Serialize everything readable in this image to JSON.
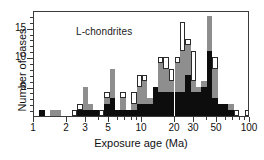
{
  "figure": {
    "annotation": "L-chondrites",
    "background": "#ffffff"
  },
  "axes": {
    "x_title": "Exposure age (Ma)",
    "y_title": "Number of cases",
    "x_scale": "log",
    "x_tick_labels": [
      "1",
      "2",
      "3",
      "5",
      "10",
      "20",
      "30",
      "50",
      "100"
    ],
    "y_tick_labels": [
      "5",
      "10",
      "15"
    ]
  },
  "colors": {
    "filled_black": "#0d0d0d",
    "filled_gray": "#8e8e8e",
    "open_white": "#ffffff",
    "axis": "#3a3a3a",
    "text": "#111111"
  },
  "chart_data": {
    "type": "bar",
    "title": "L-chondrites",
    "xlabel": "Exposure age (Ma)",
    "ylabel": "Number of cases",
    "xscale": "log",
    "xlim": [
      1,
      100
    ],
    "ylim": [
      0,
      18
    ],
    "grid": false,
    "legend": "none",
    "stacked": true,
    "bin_edges_note": "logarithmic bins between 1 and 100 Ma",
    "series": [
      {
        "name": "black",
        "color": "#0d0d0d"
      },
      {
        "name": "gray",
        "color": "#8e8e8e"
      },
      {
        "name": "white",
        "color": "#ffffff"
      }
    ],
    "bins": [
      {
        "x0": 1.0,
        "x1": 1.12,
        "black": 0,
        "gray": 0,
        "white": 0
      },
      {
        "x0": 1.12,
        "x1": 1.26,
        "black": 1,
        "gray": 0,
        "white": 0
      },
      {
        "x0": 1.26,
        "x1": 1.41,
        "black": 0,
        "gray": 0,
        "white": 0
      },
      {
        "x0": 1.41,
        "x1": 1.58,
        "black": 0,
        "gray": 1,
        "white": 0
      },
      {
        "x0": 1.58,
        "x1": 1.78,
        "black": 0,
        "gray": 1,
        "white": 0
      },
      {
        "x0": 1.78,
        "x1": 2.0,
        "black": 0,
        "gray": 0,
        "white": 0
      },
      {
        "x0": 2.0,
        "x1": 2.24,
        "black": 0,
        "gray": 0,
        "white": 0
      },
      {
        "x0": 2.24,
        "x1": 2.51,
        "black": 0,
        "gray": 0,
        "white": 1
      },
      {
        "x0": 2.51,
        "x1": 2.82,
        "black": 1,
        "gray": 0,
        "white": 1
      },
      {
        "x0": 2.82,
        "x1": 3.16,
        "black": 1,
        "gray": 4,
        "white": 0
      },
      {
        "x0": 3.16,
        "x1": 3.55,
        "black": 1,
        "gray": 1,
        "white": 0
      },
      {
        "x0": 3.55,
        "x1": 3.98,
        "black": 1,
        "gray": 0,
        "white": 0
      },
      {
        "x0": 3.98,
        "x1": 4.47,
        "black": 0,
        "gray": 0,
        "white": 1
      },
      {
        "x0": 4.47,
        "x1": 5.01,
        "black": 2,
        "gray": 1,
        "white": 1
      },
      {
        "x0": 5.01,
        "x1": 5.62,
        "black": 3,
        "gray": 5,
        "white": 0
      },
      {
        "x0": 5.62,
        "x1": 6.31,
        "black": 1,
        "gray": 0,
        "white": 0
      },
      {
        "x0": 6.31,
        "x1": 7.08,
        "black": 1,
        "gray": 2,
        "white": 1
      },
      {
        "x0": 7.08,
        "x1": 7.94,
        "black": 1,
        "gray": 0,
        "white": 0
      },
      {
        "x0": 7.94,
        "x1": 8.91,
        "black": 1,
        "gray": 1,
        "white": 2
      },
      {
        "x0": 8.91,
        "x1": 10.0,
        "black": 2,
        "gray": 3,
        "white": 2
      },
      {
        "x0": 10.0,
        "x1": 11.2,
        "black": 2,
        "gray": 4,
        "white": 1
      },
      {
        "x0": 11.2,
        "x1": 12.6,
        "black": 2,
        "gray": 1,
        "white": 0
      },
      {
        "x0": 12.6,
        "x1": 14.1,
        "black": 5,
        "gray": 0,
        "white": 0
      },
      {
        "x0": 14.1,
        "x1": 15.8,
        "black": 4,
        "gray": 5,
        "white": 1
      },
      {
        "x0": 15.8,
        "x1": 17.8,
        "black": 4,
        "gray": 4,
        "white": 2
      },
      {
        "x0": 17.8,
        "x1": 20.0,
        "black": 4,
        "gray": 2,
        "white": 2
      },
      {
        "x0": 20.0,
        "x1": 22.4,
        "black": 4,
        "gray": 5,
        "white": 1
      },
      {
        "x0": 22.4,
        "x1": 25.1,
        "black": 4,
        "gray": 7,
        "white": 5
      },
      {
        "x0": 25.1,
        "x1": 28.2,
        "black": 7,
        "gray": 5,
        "white": 1
      },
      {
        "x0": 28.2,
        "x1": 31.6,
        "black": 4,
        "gray": 2,
        "white": 5
      },
      {
        "x0": 31.6,
        "x1": 35.5,
        "black": 4,
        "gray": 1,
        "white": 0
      },
      {
        "x0": 35.5,
        "x1": 39.8,
        "black": 5,
        "gray": 1,
        "white": 0
      },
      {
        "x0": 39.8,
        "x1": 44.7,
        "black": 11,
        "gray": 6,
        "white": 0
      },
      {
        "x0": 44.7,
        "x1": 50.1,
        "black": 3,
        "gray": 5,
        "white": 2
      },
      {
        "x0": 50.1,
        "x1": 56.2,
        "black": 2,
        "gray": 0,
        "white": 0
      },
      {
        "x0": 56.2,
        "x1": 63.1,
        "black": 2,
        "gray": 0,
        "white": 0
      },
      {
        "x0": 63.1,
        "x1": 70.8,
        "black": 1,
        "gray": 1,
        "white": 0
      },
      {
        "x0": 70.8,
        "x1": 79.4,
        "black": 0,
        "gray": 0,
        "white": 1
      },
      {
        "x0": 79.4,
        "x1": 89.1,
        "black": 0,
        "gray": 0,
        "white": 0
      },
      {
        "x0": 89.1,
        "x1": 100.0,
        "black": 0,
        "gray": 0,
        "white": 1
      }
    ]
  }
}
